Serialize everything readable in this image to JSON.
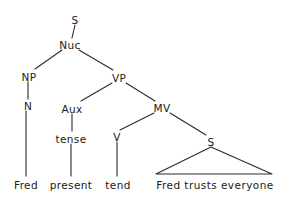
{
  "diagram": {
    "kind": "syntax-tree",
    "background_color": "#ffffff",
    "line_color": "#2b2b2b",
    "text_color": "#1a1a1a",
    "nodes": [
      {
        "id": "s-root",
        "label": "S",
        "x": 75,
        "y": 20
      },
      {
        "id": "nuc",
        "label": "Nuc",
        "x": 70,
        "y": 45
      },
      {
        "id": "np",
        "label": "NP",
        "x": 29,
        "y": 77
      },
      {
        "id": "vp",
        "label": "VP",
        "x": 119,
        "y": 78
      },
      {
        "id": "n",
        "label": "N",
        "x": 28,
        "y": 106
      },
      {
        "id": "aux",
        "label": "Aux",
        "x": 72,
        "y": 109
      },
      {
        "id": "mv",
        "label": "MV",
        "x": 162,
        "y": 108
      },
      {
        "id": "tense",
        "label": "tense",
        "x": 71,
        "y": 139
      },
      {
        "id": "v",
        "label": "V",
        "x": 117,
        "y": 137
      },
      {
        "id": "s-embed",
        "label": "S",
        "x": 211,
        "y": 142
      }
    ],
    "leaves": [
      {
        "id": "leaf-fred",
        "label": "Fred",
        "x": 26,
        "y": 185
      },
      {
        "id": "leaf-present",
        "label": "present",
        "x": 71,
        "y": 185
      },
      {
        "id": "leaf-tend",
        "label": "tend",
        "x": 118,
        "y": 185
      }
    ],
    "triangle": {
      "id": "embedded-clause-triangle",
      "label": "Fred trusts everyone",
      "apex_x": 211,
      "apex_y": 147,
      "base_left_x": 156,
      "base_right_x": 272,
      "base_y": 174,
      "label_x": 215,
      "label_y": 185
    },
    "edges": [
      {
        "id": "edge-s-nuc",
        "from": "s-root",
        "to": "nuc",
        "x1": 75,
        "y1": 25,
        "x2": 72,
        "y2": 38
      },
      {
        "id": "edge-nuc-np",
        "from": "nuc",
        "to": "np",
        "x1": 62,
        "y1": 50,
        "x2": 35,
        "y2": 69
      },
      {
        "id": "edge-nuc-vp",
        "from": "nuc",
        "to": "vp",
        "x1": 79,
        "y1": 50,
        "x2": 113,
        "y2": 70
      },
      {
        "id": "edge-np-n",
        "from": "np",
        "to": "n",
        "x1": 28,
        "y1": 82,
        "x2": 28,
        "y2": 99
      },
      {
        "id": "edge-n-fred",
        "from": "n",
        "to": "leaf-fred",
        "x1": 26,
        "y1": 111,
        "x2": 26,
        "y2": 176
      },
      {
        "id": "edge-vp-aux",
        "from": "vp",
        "to": "aux",
        "x1": 112,
        "y1": 83,
        "x2": 81,
        "y2": 101
      },
      {
        "id": "edge-vp-mv",
        "from": "vp",
        "to": "mv",
        "x1": 126,
        "y1": 83,
        "x2": 155,
        "y2": 101
      },
      {
        "id": "edge-aux-tense",
        "from": "aux",
        "to": "tense",
        "x1": 72,
        "y1": 114,
        "x2": 72,
        "y2": 131
      },
      {
        "id": "edge-tense-present",
        "from": "tense",
        "to": "leaf-present",
        "x1": 71,
        "y1": 144,
        "x2": 71,
        "y2": 176
      },
      {
        "id": "edge-mv-v",
        "from": "mv",
        "to": "v",
        "x1": 154,
        "y1": 113,
        "x2": 120,
        "y2": 130
      },
      {
        "id": "edge-mv-s",
        "from": "mv",
        "to": "s-embed",
        "x1": 170,
        "y1": 113,
        "x2": 206,
        "y2": 135
      },
      {
        "id": "edge-v-tend",
        "from": "v",
        "to": "leaf-tend",
        "x1": 117,
        "y1": 142,
        "x2": 117,
        "y2": 176
      }
    ]
  }
}
